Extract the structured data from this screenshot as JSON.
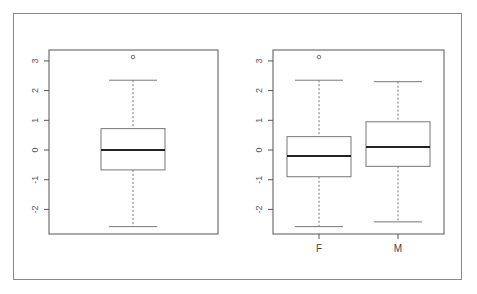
{
  "chart_data": [
    {
      "type": "boxplot",
      "title": "",
      "xlabel": "",
      "ylabel": "",
      "ylim": [
        -2.9,
        3.35
      ],
      "yticks": [
        -2,
        -1,
        0,
        1,
        2,
        3
      ],
      "grid": false,
      "categories": [
        ""
      ],
      "boxes": [
        {
          "name": "all",
          "whisker_low": -2.58,
          "q1": -0.67,
          "median": 0.0,
          "q3": 0.72,
          "whisker_high": 2.35,
          "outliers": [
            3.13
          ]
        }
      ]
    },
    {
      "type": "boxplot",
      "title": "",
      "xlabel": "",
      "ylabel": "",
      "ylim": [
        -2.9,
        3.35
      ],
      "yticks": [
        -2,
        -1,
        0,
        1,
        2,
        3
      ],
      "grid": false,
      "categories": [
        "F",
        "M"
      ],
      "boxes": [
        {
          "name": "F",
          "whisker_low": -2.58,
          "q1": -0.9,
          "median": -0.2,
          "q3": 0.45,
          "whisker_high": 2.35,
          "outliers": [
            3.13
          ]
        },
        {
          "name": "M",
          "whisker_low": -2.42,
          "q1": -0.55,
          "median": 0.1,
          "q3": 0.95,
          "whisker_high": 2.3,
          "outliers": []
        }
      ]
    }
  ],
  "colors": {
    "axis": "#555555",
    "box": "#777777",
    "median": "#222222",
    "frame": "#8a8a8a"
  }
}
